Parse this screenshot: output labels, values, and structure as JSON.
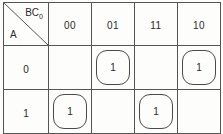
{
  "kmap": {
    "corner": {
      "column_variable_label": "BC",
      "column_variable_subscript": "0",
      "row_variable_label": "A"
    },
    "column_headers": [
      "00",
      "01",
      "11",
      "10"
    ],
    "row_headers": [
      "0",
      "1"
    ],
    "rows": [
      {
        "header": "0",
        "cells": [
          {
            "value": "",
            "grouped": false
          },
          {
            "value": "1",
            "grouped": true
          },
          {
            "value": "",
            "grouped": false
          },
          {
            "value": "1",
            "grouped": true
          }
        ]
      },
      {
        "header": "1",
        "cells": [
          {
            "value": "1",
            "grouped": true
          },
          {
            "value": "",
            "grouped": false
          },
          {
            "value": "1",
            "grouped": true
          },
          {
            "value": "",
            "grouped": false
          }
        ]
      }
    ],
    "colors": {
      "grid_line": "#555555",
      "ring": "#4a4a4a",
      "text": "#2a2a2a",
      "background": "#fdfdfc"
    }
  }
}
